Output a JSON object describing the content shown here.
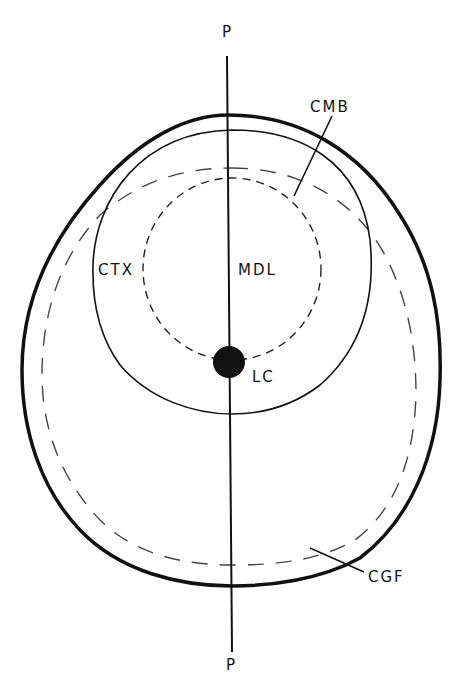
{
  "diagram": {
    "labels": {
      "top_axis": "P",
      "bottom_axis": "P",
      "cortex": "CTX",
      "medulla": "MDL",
      "lateral_cell": "LC",
      "cortex_medulla_boundary": "CMB",
      "cgf": "CGF"
    },
    "colors": {
      "ink": "#111111",
      "dashed": "#444444",
      "background": "#ffffff"
    }
  }
}
